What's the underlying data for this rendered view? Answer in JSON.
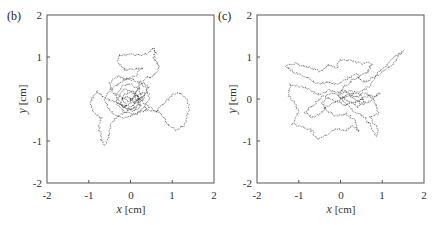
{
  "chart_data": [
    {
      "type": "scatter",
      "panel_label": "(b)",
      "title": "",
      "xlabel_var": "x",
      "xlabel_unit": "[cm]",
      "ylabel_var": "y",
      "ylabel_unit": "[cm]",
      "xlim": [
        -2,
        2
      ],
      "ylim": [
        -2,
        2
      ],
      "xticks": [
        "-2",
        "-1",
        "0",
        "1",
        "2"
      ],
      "yticks": [
        "2",
        "1",
        "0",
        "-1",
        "-2"
      ],
      "grid": false,
      "style": "dotted trajectory (random walk)",
      "extent": {
        "x": [
          -0.95,
          1.4
        ],
        "y": [
          -1.1,
          1.2
        ]
      },
      "trace": [
        [
          0,
          0
        ],
        [
          0.1,
          -0.1
        ],
        [
          0.2,
          0.05
        ],
        [
          0.05,
          0.2
        ],
        [
          -0.15,
          0.1
        ],
        [
          -0.25,
          -0.1
        ],
        [
          -0.1,
          -0.25
        ],
        [
          0.15,
          -0.2
        ],
        [
          0.3,
          0.0
        ],
        [
          0.2,
          0.25
        ],
        [
          0.0,
          0.35
        ],
        [
          -0.2,
          0.3
        ],
        [
          -0.35,
          0.1
        ],
        [
          -0.3,
          -0.15
        ],
        [
          -0.15,
          -0.3
        ],
        [
          0.1,
          -0.35
        ],
        [
          0.35,
          -0.2
        ],
        [
          0.45,
          0.05
        ],
        [
          0.35,
          0.3
        ],
        [
          0.1,
          0.45
        ],
        [
          -0.1,
          0.5
        ],
        [
          -0.3,
          0.35
        ],
        [
          -0.5,
          0.2
        ],
        [
          -0.6,
          0.0
        ],
        [
          -0.55,
          -0.2
        ],
        [
          -0.4,
          -0.35
        ],
        [
          -0.2,
          -0.45
        ],
        [
          0.05,
          -0.4
        ],
        [
          0.25,
          -0.3
        ],
        [
          0.4,
          -0.25
        ],
        [
          0.6,
          -0.3
        ],
        [
          0.8,
          -0.1
        ],
        [
          1.0,
          0.1
        ],
        [
          1.2,
          0.15
        ],
        [
          1.38,
          0.0
        ],
        [
          1.4,
          -0.3
        ],
        [
          1.3,
          -0.6
        ],
        [
          1.1,
          -0.75
        ],
        [
          0.9,
          -0.6
        ],
        [
          0.75,
          -0.35
        ],
        [
          0.55,
          -0.25
        ],
        [
          0.3,
          -0.1
        ],
        [
          0.1,
          0.1
        ],
        [
          0.2,
          0.4
        ],
        [
          0.4,
          0.5
        ],
        [
          0.6,
          0.6
        ],
        [
          0.7,
          0.8
        ],
        [
          0.55,
          0.95
        ],
        [
          0.6,
          1.1
        ],
        [
          0.55,
          1.2
        ],
        [
          0.35,
          1.05
        ],
        [
          0.05,
          1.05
        ],
        [
          -0.25,
          1.05
        ],
        [
          -0.3,
          0.85
        ],
        [
          -0.15,
          0.7
        ],
        [
          0.1,
          0.7
        ],
        [
          0.3,
          0.75
        ],
        [
          0.1,
          0.55
        ],
        [
          -0.1,
          0.45
        ],
        [
          -0.3,
          0.55
        ],
        [
          -0.5,
          0.4
        ],
        [
          -0.45,
          0.2
        ],
        [
          -0.25,
          0.05
        ],
        [
          -0.05,
          -0.05
        ],
        [
          0.15,
          0.1
        ],
        [
          0.35,
          0.15
        ],
        [
          0.2,
          -0.05
        ],
        [
          0.0,
          -0.2
        ],
        [
          -0.2,
          -0.15
        ],
        [
          -0.4,
          -0.05
        ],
        [
          -0.65,
          0.05
        ],
        [
          -0.8,
          0.2
        ],
        [
          -0.95,
          -0.05
        ],
        [
          -0.9,
          -0.3
        ],
        [
          -0.7,
          -0.45
        ],
        [
          -0.75,
          -0.7
        ],
        [
          -0.7,
          -0.95
        ],
        [
          -0.62,
          -1.1
        ],
        [
          -0.5,
          -0.85
        ],
        [
          -0.45,
          -0.55
        ],
        [
          -0.3,
          -0.4
        ],
        [
          -0.1,
          -0.3
        ],
        [
          0.1,
          -0.2
        ],
        [
          0.25,
          0.0
        ],
        [
          0.05,
          0.15
        ],
        [
          -0.15,
          0.25
        ],
        [
          -0.3,
          0.05
        ],
        [
          -0.2,
          -0.2
        ],
        [
          0.0,
          -0.1
        ],
        [
          0.15,
          0.2
        ],
        [
          0.3,
          0.4
        ],
        [
          0.45,
          0.25
        ],
        [
          0.3,
          0.05
        ],
        [
          0.1,
          -0.05
        ],
        [
          -0.05,
          0.05
        ],
        [
          -0.2,
          0.0
        ],
        [
          -0.1,
          -0.2
        ],
        [
          0.1,
          -0.3
        ],
        [
          0.25,
          -0.15
        ],
        [
          0.1,
          0.05
        ]
      ]
    },
    {
      "type": "scatter",
      "panel_label": "(c)",
      "title": "",
      "xlabel_var": "x",
      "xlabel_unit": "[cm]",
      "ylabel_var": "y",
      "ylabel_unit": "[cm]",
      "xlim": [
        -2,
        2
      ],
      "ylim": [
        -2,
        2
      ],
      "xticks": [
        "-2",
        "-1",
        "0",
        "1",
        "2"
      ],
      "yticks": [
        "2",
        "1",
        "0",
        "-1",
        "-2"
      ],
      "grid": false,
      "style": "dotted trajectory (random walk)",
      "extent": {
        "x": [
          -1.3,
          1.5
        ],
        "y": [
          -0.95,
          1.15
        ]
      },
      "trace": [
        [
          0,
          0
        ],
        [
          0.2,
          0.1
        ],
        [
          0.4,
          0.05
        ],
        [
          0.6,
          0.15
        ],
        [
          0.8,
          0.05
        ],
        [
          0.95,
          0.15
        ],
        [
          0.75,
          -0.05
        ],
        [
          0.5,
          -0.1
        ],
        [
          0.3,
          0.05
        ],
        [
          0.1,
          0.2
        ],
        [
          -0.1,
          0.15
        ],
        [
          -0.3,
          0.2
        ],
        [
          -0.5,
          0.1
        ],
        [
          -0.7,
          0.2
        ],
        [
          -0.9,
          0.3
        ],
        [
          -1.2,
          0.35
        ],
        [
          -1.25,
          0.1
        ],
        [
          -1.1,
          -0.1
        ],
        [
          -1.0,
          -0.3
        ],
        [
          -1.15,
          -0.6
        ],
        [
          -0.9,
          -0.65
        ],
        [
          -0.7,
          -0.75
        ],
        [
          -0.55,
          -0.95
        ],
        [
          -0.3,
          -0.85
        ],
        [
          -0.1,
          -0.7
        ],
        [
          0.1,
          -0.75
        ],
        [
          0.3,
          -0.65
        ],
        [
          0.45,
          -0.8
        ],
        [
          0.35,
          -0.5
        ],
        [
          0.15,
          -0.35
        ],
        [
          -0.1,
          -0.4
        ],
        [
          -0.3,
          -0.3
        ],
        [
          -0.45,
          -0.1
        ],
        [
          -0.3,
          0.05
        ],
        [
          -0.1,
          -0.05
        ],
        [
          0.1,
          -0.15
        ],
        [
          0.3,
          -0.1
        ],
        [
          0.5,
          0.0
        ],
        [
          0.7,
          0.1
        ],
        [
          0.85,
          -0.1
        ],
        [
          0.9,
          -0.35
        ],
        [
          0.7,
          -0.45
        ],
        [
          0.9,
          -0.7
        ],
        [
          0.85,
          -0.9
        ],
        [
          0.7,
          -0.6
        ],
        [
          0.55,
          -0.4
        ],
        [
          0.35,
          -0.3
        ],
        [
          0.1,
          -0.1
        ],
        [
          -0.05,
          0.1
        ],
        [
          0.1,
          0.3
        ],
        [
          0.3,
          0.45
        ],
        [
          0.5,
          0.55
        ],
        [
          0.7,
          0.7
        ],
        [
          0.75,
          0.85
        ],
        [
          0.5,
          0.85
        ],
        [
          0.25,
          0.9
        ],
        [
          0.0,
          0.95
        ],
        [
          -0.1,
          0.75
        ],
        [
          -0.3,
          0.8
        ],
        [
          -0.5,
          0.65
        ],
        [
          -0.7,
          0.75
        ],
        [
          -0.9,
          0.8
        ],
        [
          -1.1,
          0.85
        ],
        [
          -1.3,
          0.8
        ],
        [
          -1.15,
          0.65
        ],
        [
          -0.9,
          0.55
        ],
        [
          -0.7,
          0.45
        ],
        [
          -0.5,
          0.35
        ],
        [
          -0.3,
          0.4
        ],
        [
          -0.1,
          0.35
        ],
        [
          0.1,
          0.45
        ],
        [
          0.35,
          0.6
        ],
        [
          0.55,
          0.4
        ],
        [
          0.75,
          0.5
        ],
        [
          0.95,
          0.6
        ],
        [
          1.15,
          0.75
        ],
        [
          1.35,
          0.95
        ],
        [
          1.5,
          1.15
        ],
        [
          1.3,
          1.0
        ],
        [
          1.1,
          0.8
        ],
        [
          0.9,
          0.65
        ],
        [
          0.7,
          0.3
        ],
        [
          0.5,
          0.2
        ],
        [
          0.3,
          0.15
        ],
        [
          0.1,
          0.05
        ],
        [
          -0.1,
          -0.05
        ],
        [
          -0.3,
          -0.15
        ],
        [
          -0.5,
          -0.35
        ],
        [
          -0.7,
          -0.45
        ],
        [
          -0.85,
          -0.3
        ],
        [
          -0.65,
          -0.15
        ],
        [
          -0.45,
          0.05
        ],
        [
          -0.2,
          0.15
        ],
        [
          0.0,
          0.05
        ],
        [
          0.2,
          -0.05
        ],
        [
          0.4,
          -0.2
        ],
        [
          0.6,
          -0.1
        ],
        [
          0.45,
          0.1
        ],
        [
          0.2,
          0.2
        ],
        [
          0.0,
          0.1
        ]
      ]
    }
  ]
}
